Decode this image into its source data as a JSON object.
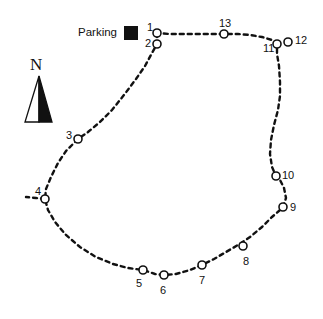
{
  "map": {
    "title": "Trail route map with numbered stops",
    "background_color": "#ffffff",
    "ink_color": "#111111",
    "legend": {
      "parking_label": "Parking",
      "parking_symbol": "filled-square",
      "parking_color": "#111111",
      "x": 78,
      "y": 26
    },
    "compass": {
      "letter": "N",
      "x": 22,
      "y": 56,
      "arrow_color_left": "#ffffff",
      "arrow_color_right": "#111111"
    },
    "trail": {
      "style": "dashed",
      "dash_pattern": "4 4",
      "stroke_width": 2.4,
      "color": "#111111",
      "loop_path": "M 157,33 L 157,44 L 152,53 L 145,66 L 136,79 L 124,95 L 112,110 L 100,122 L 88,132 L 78,139 L 66,151 L 58,163 L 51,177 L 46,189 L 45,199 L 48,210 L 55,222 L 66,235 L 80,247 L 96,257 L 113,264 L 128,268 L 143,270 L 155,274 L 164,275 L 176,274 L 190,270 L 202,265 L 214,259 L 226,252 L 238,245 L 250,237 L 262,227 L 272,217 L 280,210 L 283,207 L 286,198 L 284,188 L 280,180 L 276,176 L 272,167 L 270,154 L 271,140 L 274,125 L 278,110 L 280,96 L 280,82 L 279,66 L 277,54 L 277,44 L 272,40 L 262,37 L 250,35 L 238,34 L 224,34 L 210,34 L 196,34 L 182,34 L 170,34 L 157,33 Z",
      "spur_path": "M 45,199 L 36,198 L 26,197",
      "spur_note": "short dashed access spur west of stop 4"
    },
    "stops": [
      {
        "id": "1",
        "cx": 157,
        "cy": 33,
        "label": "1",
        "label_x": 147,
        "label_y": 22
      },
      {
        "id": "2",
        "cx": 157,
        "cy": 44,
        "label": "2",
        "label_x": 145,
        "label_y": 38
      },
      {
        "id": "3",
        "cx": 78,
        "cy": 139,
        "label": "3",
        "label_x": 66,
        "label_y": 130
      },
      {
        "id": "4",
        "cx": 45,
        "cy": 199,
        "label": "4",
        "label_x": 35,
        "label_y": 186
      },
      {
        "id": "5",
        "cx": 143,
        "cy": 270,
        "label": "5",
        "label_x": 136,
        "label_y": 278
      },
      {
        "id": "6",
        "cx": 164,
        "cy": 275,
        "label": "6",
        "label_x": 160,
        "label_y": 285
      },
      {
        "id": "7",
        "cx": 202,
        "cy": 265,
        "label": "7",
        "label_x": 199,
        "label_y": 275
      },
      {
        "id": "8",
        "cx": 243,
        "cy": 246,
        "label": "8",
        "label_x": 243,
        "label_y": 256
      },
      {
        "id": "9",
        "cx": 283,
        "cy": 207,
        "label": "9",
        "label_x": 290,
        "label_y": 202
      },
      {
        "id": "10",
        "cx": 276,
        "cy": 176,
        "label": "10",
        "label_x": 282,
        "label_y": 170
      },
      {
        "id": "11",
        "cx": 277,
        "cy": 44,
        "label": "11",
        "label_x": 263,
        "label_y": 43
      },
      {
        "id": "12",
        "cx": 288,
        "cy": 42,
        "label": "12",
        "label_x": 295,
        "label_y": 35
      },
      {
        "id": "13",
        "cx": 224,
        "cy": 34,
        "label": "13",
        "label_x": 219,
        "label_y": 18
      }
    ],
    "stop_marker": {
      "shape": "circle",
      "radius": 4,
      "fill": "#ffffff",
      "stroke": "#111111",
      "stroke_width": 1.6
    }
  }
}
